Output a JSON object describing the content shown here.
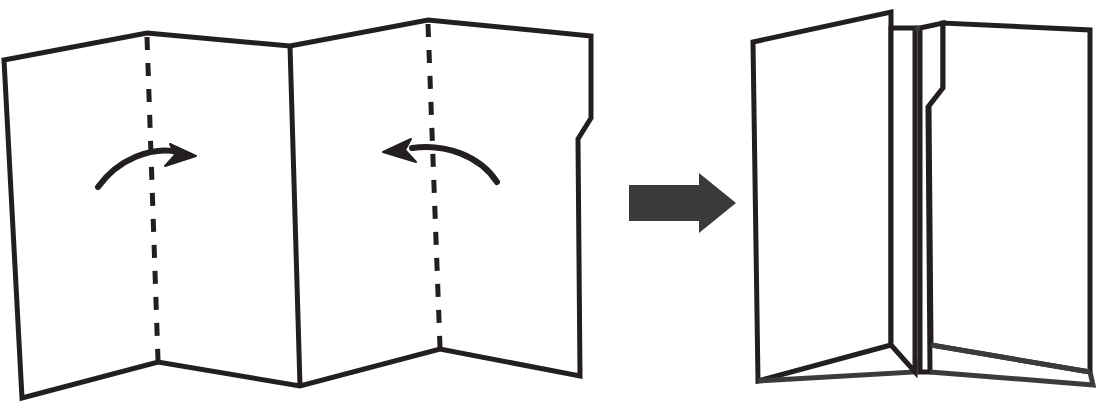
{
  "figure": {
    "title": "Map folding instruction diagram",
    "description": "A flat accordion-style map on the left with two dashed fold lines and two curved arrows indicating the outer panels fold inward, an arrow pointing right, and the resulting folded map on the right.",
    "background_color": "#ffffff",
    "ink_color": "#231f20",
    "arrow_fill_color": "#3a3a3a"
  },
  "left_illustration": {
    "name": "unfolded-map",
    "label": "Unfolded map",
    "panel_count": 4,
    "fold_lines": [
      {
        "name": "fold-line-left",
        "style": "dashed",
        "label": "Left fold crease"
      },
      {
        "name": "fold-line-right",
        "style": "dashed",
        "label": "Right fold crease"
      }
    ],
    "creases": [
      {
        "name": "crease-center",
        "style": "solid",
        "label": "Center valley crease"
      }
    ],
    "motion_arrows": [
      {
        "name": "fold-arrow-left",
        "direction": "right",
        "label": "Fold left panel inward to the right"
      },
      {
        "name": "fold-arrow-right",
        "direction": "left",
        "label": "Fold right panel inward to the left"
      }
    ],
    "notch": {
      "name": "edge-notch",
      "label": "Notch cut in right edge"
    }
  },
  "transition": {
    "name": "transition-arrow",
    "label": "Results in",
    "direction": "right"
  },
  "right_illustration": {
    "name": "folded-map",
    "label": "Folded map",
    "panels": [
      {
        "name": "folded-panel-left",
        "label": "Left folded panel"
      },
      {
        "name": "folded-flap-inner-left",
        "label": "Inner left flap"
      },
      {
        "name": "folded-flap-inner-right",
        "label": "Inner right flap with notch"
      },
      {
        "name": "folded-panel-right",
        "label": "Right folded panel"
      }
    ]
  }
}
